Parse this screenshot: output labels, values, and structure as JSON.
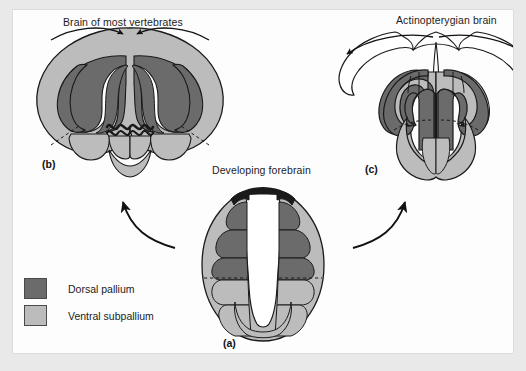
{
  "figure": {
    "background_color": "#e9e9e9",
    "panel_color": "#fdfdfd",
    "stroke_color": "#1a1a1a"
  },
  "colors": {
    "dorsal_pallium": "#6b6b6b",
    "ventral_subpallium": "#bcbcbc",
    "roof_plate": "#1a1a1a",
    "ventricle": "#ffffff"
  },
  "captions": {
    "panel_b_title": "Brain of most vertebrates",
    "panel_a_title": "Developing forebrain",
    "panel_c_title": "Actinopterygian brain"
  },
  "panel_labels": {
    "b": "(b)",
    "a": "(a)",
    "c": "(c)"
  },
  "legend": {
    "items": [
      {
        "label": "Dorsal pallium",
        "color": "#6b6b6b"
      },
      {
        "label": "Ventral subpallium",
        "color": "#bcbcbc"
      }
    ]
  },
  "arrows": {
    "left_transform": "evagination",
    "right_transform": "eversion"
  }
}
